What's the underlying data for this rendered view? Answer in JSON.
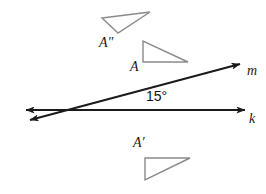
{
  "figure": {
    "type": "geometry-diagram",
    "background_color": "#ffffff",
    "line_color": "#1a1a1a",
    "triangle_color": "#808080",
    "width": 266,
    "height": 194
  },
  "labels": {
    "triangle_a": "A",
    "triangle_a_prime": "A′",
    "triangle_a_double_prime": "A″",
    "line_m": "m",
    "line_k": "k",
    "angle": "15°"
  },
  "lines": [
    {
      "name": "m",
      "label": "m",
      "style": "double-headed-arrow",
      "from": [
        22,
        122
      ],
      "to": [
        247,
        62
      ],
      "arrow_start": true,
      "arrow_end": true
    },
    {
      "name": "k",
      "label": "k",
      "style": "double-headed-arrow",
      "from": [
        18,
        110
      ],
      "to": [
        252,
        110
      ],
      "arrow_start": true,
      "arrow_end": true
    }
  ],
  "intersection": {
    "name": "lines-intersection",
    "point": [
      85,
      110
    ],
    "angle_degrees": 15,
    "angle_label": "15°"
  },
  "triangles": [
    {
      "name": "triangle-A",
      "label": "A",
      "right_angle_at": "top-left",
      "vertices": [
        [
          143,
          41
        ],
        [
          143,
          62
        ],
        [
          188,
          62
        ]
      ]
    },
    {
      "name": "triangle-A-prime",
      "label": "A′",
      "right_angle_at": "bottom-left",
      "vertices": [
        [
          145,
          158
        ],
        [
          145,
          180
        ],
        [
          190,
          158
        ]
      ]
    },
    {
      "name": "triangle-A-double-prime",
      "label": "A″",
      "right_angle_at": "rotated-left",
      "vertices": [
        [
          102,
          18
        ],
        [
          150,
          12
        ],
        [
          118,
          33
        ]
      ]
    }
  ]
}
